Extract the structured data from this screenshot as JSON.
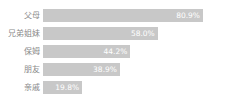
{
  "chart_data": {
    "type": "bar",
    "orientation": "horizontal",
    "title": "",
    "xlabel": "",
    "ylabel": "",
    "xlim": [
      0,
      100
    ],
    "grid": false,
    "legend": false,
    "unit": "%",
    "categories": [
      "父母",
      "兄弟姐妹",
      "保姆",
      "朋友",
      "亲戚"
    ],
    "values": [
      80.9,
      58.0,
      44.2,
      38.9,
      19.8
    ],
    "value_labels": [
      "80.9%",
      "58.0%",
      "44.2%",
      "38.9%",
      "19.8%"
    ],
    "bar_color": "#c8c8c8",
    "value_label_color": "#ffffff",
    "category_label_color": "#8a8a8a",
    "background_color": "#ffffff"
  },
  "rows": [
    {
      "label": "父母",
      "value": 80.9,
      "value_label": "80.9%"
    },
    {
      "label": "兄弟姐妹",
      "value": 58.0,
      "value_label": "58.0%"
    },
    {
      "label": "保姆",
      "value": 44.2,
      "value_label": "44.2%"
    },
    {
      "label": "朋友",
      "value": 38.9,
      "value_label": "38.9%"
    },
    {
      "label": "亲戚",
      "value": 19.8,
      "value_label": "19.8%"
    }
  ]
}
